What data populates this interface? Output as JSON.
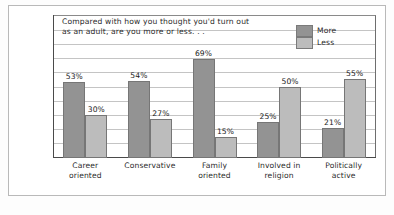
{
  "chart_data": {
    "type": "bar",
    "title": "Compared with how you thought you'd turn out\nas an adult, are you more or less. . .",
    "xlabel": "",
    "ylabel": "",
    "ylim": [
      0,
      100
    ],
    "grid": true,
    "legend_position": "top-right",
    "categories": [
      "Career\noriented",
      "Conservative",
      "Family\noriented",
      "Involved in\nreligion",
      "Politically\nactive"
    ],
    "series": [
      {
        "name": "More",
        "color": "#939393",
        "values": [
          53,
          54,
          69,
          25,
          21
        ],
        "labels": [
          "53%",
          "54%",
          "69%",
          "25%",
          "21%"
        ]
      },
      {
        "name": "Less",
        "color": "#bcbcbc",
        "values": [
          30,
          27,
          15,
          50,
          55
        ],
        "labels": [
          "30%",
          "27%",
          "15%",
          "50%",
          "55%"
        ]
      }
    ]
  },
  "legend": {
    "items": [
      {
        "label": "More",
        "color": "#939393"
      },
      {
        "label": "Less",
        "color": "#bcbcbc"
      }
    ]
  }
}
